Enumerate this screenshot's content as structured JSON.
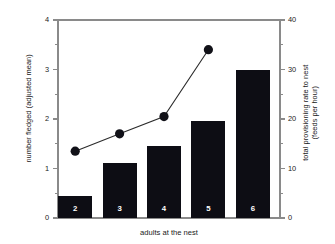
{
  "chart_data": {
    "type": "bar",
    "title": "",
    "subtitle": "",
    "xlabel": "adults at the nest",
    "ylabel": "number fledged (adjusted mean)",
    "y2label_line1": "total provisioning rate to nest",
    "y2label_line2": "(feeds per hour)",
    "categories": [
      "2",
      "3",
      "4",
      "5",
      "6"
    ],
    "ylim": [
      0,
      4
    ],
    "y2lim": [
      0,
      40
    ],
    "yticks": [
      "0",
      "1",
      "2",
      "3",
      "4"
    ],
    "ytick_values": [
      0,
      1,
      2,
      3,
      4
    ],
    "yminor_values": [
      0.5,
      1.5,
      2.5,
      3.5
    ],
    "y2ticks": [
      "0",
      "10",
      "20",
      "30",
      "40"
    ],
    "y2tick_values": [
      0,
      10,
      20,
      30,
      40
    ],
    "y2minor_values": [
      5,
      15,
      25,
      35
    ],
    "grid": false,
    "legend": "none",
    "series": [
      {
        "name": "number fledged (adjusted mean)",
        "type": "bar",
        "axis": "left",
        "color": "#0d0d14",
        "values": [
          0.44,
          1.12,
          1.46,
          1.95,
          3.0
        ],
        "bar_labels": [
          "2",
          "3",
          "4",
          "5",
          "6"
        ]
      },
      {
        "name": "total provisioning rate to nest (feeds per hour)",
        "type": "line",
        "axis": "right",
        "color": "#111118",
        "marker": "filled-circle",
        "x": [
          "2",
          "3",
          "4",
          "5"
        ],
        "values": [
          13.5,
          17.0,
          20.5,
          34.0
        ]
      }
    ]
  },
  "figure": {
    "frame_color": "#8a8a8a",
    "bar_color": "#0d0d14",
    "marker_color": "#111118",
    "line_color": "#2b2b2b",
    "background": "#ffffff"
  }
}
